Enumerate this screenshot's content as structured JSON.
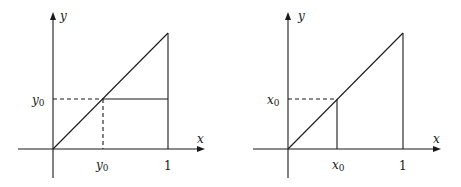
{
  "panels": [
    {
      "id": "left",
      "axis_labels": {
        "x": "x",
        "y": "y"
      },
      "tick_x_marker": {
        "base": "y",
        "sub": "0"
      },
      "tick_y_marker": {
        "base": "y",
        "sub": "0"
      },
      "tick_x_one": "1",
      "description": "Line y=x from 0 to 1; dashed horizontal from y-axis at y0 to the diagonal, dashed vertical down to x-axis at y0; solid horizontal from diagonal to x=1 at height y0; solid vertical at x=1.",
      "marker_value": 0.5
    },
    {
      "id": "right",
      "axis_labels": {
        "x": "x",
        "y": "y"
      },
      "tick_x_marker": {
        "base": "x",
        "sub": "0"
      },
      "tick_y_marker": {
        "base": "x",
        "sub": "0"
      },
      "tick_x_one": "1",
      "description": "Line y=x from 0 to 1; dashed horizontal from y-axis at x0 to the diagonal; solid vertical from diagonal down to x-axis at x0; solid vertical at x=1.",
      "marker_value": 0.43
    }
  ]
}
